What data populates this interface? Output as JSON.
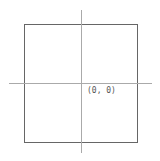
{
  "diagram": {
    "origin_label": "(0, 0)",
    "colors": {
      "square_stroke": "#666666",
      "axis_stroke": "#aaaaaa",
      "label": "#555555"
    }
  }
}
